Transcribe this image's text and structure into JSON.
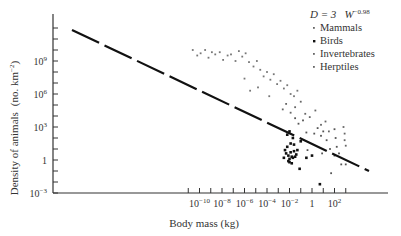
{
  "chart_data": {
    "type": "scatter",
    "title": "",
    "xlabel": "Body mass (kg)",
    "ylabel": "Density of animals (no. km^-2)",
    "xscale": "log",
    "yscale": "log",
    "xlim_log10": [
      -11.2,
      3.5
    ],
    "ylim_log10": [
      -3,
      12.3
    ],
    "x_tick_labels": [
      {
        "log": -10,
        "label": "10",
        "exp": "−10"
      },
      {
        "log": -8,
        "label": "10",
        "exp": "−8"
      },
      {
        "log": -6,
        "label": "10",
        "exp": "−6"
      },
      {
        "log": -4,
        "label": "10",
        "exp": "−4"
      },
      {
        "log": -2,
        "label": "10",
        "exp": "−2"
      },
      {
        "log": 0,
        "label": "1",
        "exp": ""
      },
      {
        "log": 2,
        "label": "10",
        "exp": "2"
      }
    ],
    "y_tick_labels": [
      {
        "log": 9,
        "label": "10",
        "exp": "9"
      },
      {
        "log": 6,
        "label": "10",
        "exp": "6"
      },
      {
        "log": 3,
        "label": "10",
        "exp": "3"
      },
      {
        "log": 0,
        "label": "1",
        "exp": ""
      },
      {
        "log": -3,
        "label": "10",
        "exp": "−3"
      }
    ],
    "grid": false,
    "legend_position": "top-right",
    "equation": {
      "lhs": "D = 3",
      "term": "W",
      "exponent": "−0.98"
    },
    "fit_line": {
      "slope": -0.98,
      "intercept_log10": 0.48,
      "x_from_log10": -10.7,
      "x_to_log10": 2.5,
      "style": "dashed"
    },
    "series": [
      {
        "name": "Mammals",
        "marker": "dot",
        "points_log10": [
          [
            -1.5,
            3.8
          ],
          [
            -1.2,
            3.3
          ],
          [
            -0.8,
            3.6
          ],
          [
            -0.5,
            2.5
          ],
          [
            0.2,
            2.4
          ],
          [
            0.5,
            2.9
          ],
          [
            0.8,
            2.2
          ],
          [
            1.0,
            2.6
          ],
          [
            1.3,
            1.8
          ],
          [
            1.6,
            1.0
          ],
          [
            2.0,
            2.8
          ],
          [
            2.1,
            2.0
          ],
          [
            2.2,
            1.2
          ],
          [
            2.4,
            0.6
          ],
          [
            2.6,
            -0.4
          ],
          [
            3.0,
            -0.4
          ],
          [
            2.0,
            0.4
          ],
          [
            1.7,
            -1.2
          ],
          [
            0.9,
            0.6
          ],
          [
            -0.4,
            0.9
          ]
        ]
      },
      {
        "name": "Birds",
        "marker": "filled-dot",
        "points_log10": [
          [
            -2.5,
            0.2
          ],
          [
            -2.3,
            0.6
          ],
          [
            -2.1,
            0.4
          ],
          [
            -2.0,
            0.1
          ],
          [
            -1.9,
            0.7
          ],
          [
            -1.8,
            0.3
          ],
          [
            -2.2,
            1.2
          ],
          [
            -1.7,
            0.2
          ],
          [
            -1.6,
            0.8
          ],
          [
            -1.5,
            0.3
          ],
          [
            -2.0,
            -0.2
          ],
          [
            -1.8,
            -0.3
          ],
          [
            -2.1,
            -0.1
          ],
          [
            -1.4,
            0.5
          ],
          [
            -1.3,
            0.9
          ],
          [
            -2.4,
            0.9
          ],
          [
            -1.9,
            1.5
          ],
          [
            -1.6,
            1.4
          ],
          [
            -2.2,
            2.3
          ],
          [
            -2.0,
            2.6
          ],
          [
            -1.7,
            2.0
          ],
          [
            -1.0,
            1.7
          ],
          [
            -0.5,
            0.2
          ],
          [
            0.0,
            0.4
          ],
          [
            0.7,
            -2.2
          ],
          [
            -1.1,
            -0.8
          ]
        ]
      },
      {
        "name": "Invertebrates",
        "marker": "small-dot",
        "points_log10": [
          [
            -10.6,
            10.0
          ],
          [
            -10.2,
            9.5
          ],
          [
            -9.9,
            9.7
          ],
          [
            -9.5,
            10.0
          ],
          [
            -9.2,
            9.3
          ],
          [
            -8.9,
            9.8
          ],
          [
            -8.6,
            9.6
          ],
          [
            -8.2,
            9.8
          ],
          [
            -7.9,
            9.1
          ],
          [
            -7.5,
            9.5
          ],
          [
            -7.2,
            9.6
          ],
          [
            -6.8,
            9.0
          ],
          [
            -6.5,
            9.9
          ],
          [
            -6.2,
            9.4
          ],
          [
            -5.9,
            9.7
          ],
          [
            -5.6,
            8.9
          ],
          [
            -5.2,
            8.5
          ],
          [
            -4.9,
            9.0
          ],
          [
            -4.6,
            8.2
          ],
          [
            -4.3,
            7.6
          ],
          [
            -4.0,
            8.0
          ],
          [
            -3.7,
            7.3
          ],
          [
            -3.4,
            7.8
          ],
          [
            -3.1,
            6.9
          ],
          [
            -2.8,
            7.2
          ],
          [
            -2.5,
            6.5
          ],
          [
            -2.2,
            6.8
          ],
          [
            -1.9,
            6.0
          ],
          [
            -1.6,
            5.8
          ],
          [
            -1.3,
            6.3
          ],
          [
            -5.5,
            6.3
          ],
          [
            -4.8,
            6.6
          ],
          [
            -6.0,
            7.4
          ],
          [
            -3.8,
            5.8
          ]
        ]
      },
      {
        "name": "Herptiles",
        "marker": "small-dot",
        "points_log10": [
          [
            -2.6,
            4.6
          ],
          [
            -2.3,
            5.1
          ],
          [
            -1.9,
            4.3
          ],
          [
            -1.5,
            4.8
          ],
          [
            -1.0,
            5.3
          ],
          [
            -0.6,
            4.2
          ],
          [
            -0.2,
            3.9
          ],
          [
            0.3,
            4.5
          ],
          [
            0.8,
            3.2
          ],
          [
            1.2,
            3.5
          ],
          [
            1.5,
            2.6
          ],
          [
            2.8,
            3.0
          ],
          [
            2.9,
            2.4
          ],
          [
            2.9,
            1.8
          ],
          [
            3.0,
            1.3
          ]
        ]
      }
    ]
  },
  "legend": {
    "equation_lhs": "D = 3",
    "equation_term": "W",
    "equation_exp": "−0.98",
    "items": [
      {
        "label": "Mammals",
        "marker": "·"
      },
      {
        "label": "Birds",
        "marker": "•"
      },
      {
        "label": "Invertebrates",
        "marker": "·"
      },
      {
        "label": "Herptiles",
        "marker": "·"
      }
    ]
  },
  "axes": {
    "x_label": "Body mass (kg)",
    "y_label": "Density of animals",
    "y_label_units": "(no. km",
    "y_label_units_exp": "−2",
    "y_label_units_close": ")"
  }
}
